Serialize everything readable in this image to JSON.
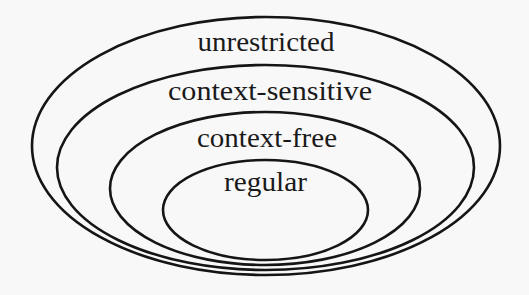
{
  "diagram": {
    "type": "nested-sets",
    "title": "",
    "sets": [
      {
        "id": "unrestricted",
        "label": "unrestricted",
        "contains": "context-sensitive"
      },
      {
        "id": "context-sensitive",
        "label": "context-sensitive",
        "contains": "context-free"
      },
      {
        "id": "context-free",
        "label": "context-free",
        "contains": "regular"
      },
      {
        "id": "regular",
        "label": "regular",
        "contains": null
      }
    ],
    "colors": {
      "stroke": "#151515",
      "text": "#1a1a1a",
      "background": "#f8f8f8"
    }
  }
}
